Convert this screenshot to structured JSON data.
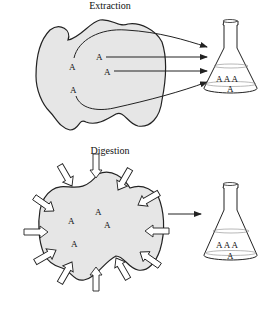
{
  "panels": [
    {
      "title": "Extraction",
      "analyte_labels": [
        "A",
        "A",
        "A",
        "A"
      ],
      "flask_labels": [
        "A A A",
        "A"
      ]
    },
    {
      "title": "Digestion",
      "analyte_labels": [
        "A",
        "A",
        "A",
        "A"
      ],
      "flask_labels": [
        "A A A",
        "A"
      ]
    }
  ],
  "colors": {
    "sample_fill": "#e6e6e6",
    "stroke": "#222222",
    "arrow_fill": "#ffffff"
  }
}
